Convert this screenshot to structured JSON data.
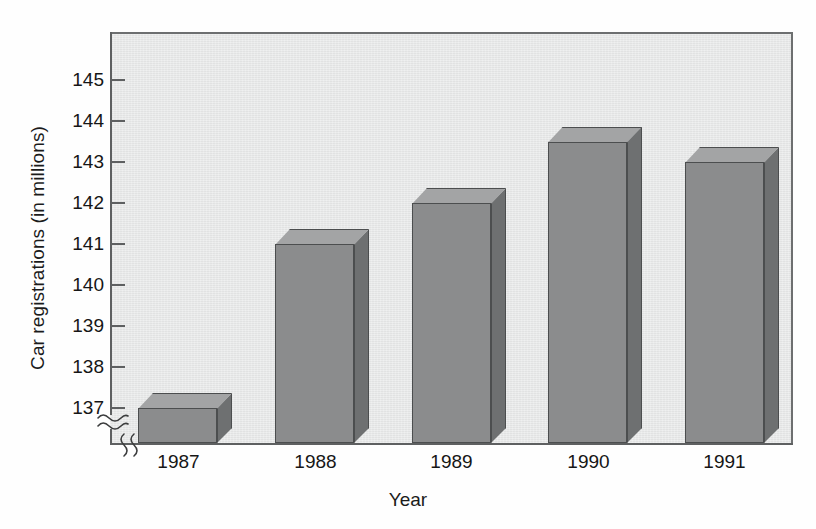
{
  "chart_data": {
    "type": "bar",
    "title": "",
    "xlabel": "Year",
    "ylabel": "Car registrations (in millions)",
    "categories": [
      "1987",
      "1988",
      "1989",
      "1990",
      "1991"
    ],
    "values": [
      137,
      141,
      142,
      143.5,
      143
    ],
    "ylim": [
      136.6,
      145.6
    ],
    "y_ticks": [
      "137",
      "138",
      "139",
      "140",
      "141",
      "142",
      "143",
      "144",
      "145"
    ],
    "y_tick_values": [
      137,
      138,
      139,
      140,
      141,
      142,
      143,
      144,
      145
    ],
    "grid": false,
    "legend": "none",
    "axis_break_y": true,
    "axis_break_x": true,
    "series": [
      {
        "name": "Car registrations",
        "values": [
          137,
          141,
          142,
          143.5,
          143
        ]
      }
    ],
    "colors": {
      "bar_front": "#8b8c8d",
      "bar_top": "#a3a4a5",
      "bar_side": "#6e7071",
      "bar_outline": "#4c4e4f",
      "plot_background": "#e8e9e9",
      "axis": "#5e6061",
      "text": "#161616",
      "page_background": "#fefefe"
    }
  },
  "axis": {
    "y_title": "Car registrations (in millions)",
    "x_title": "Year",
    "y_labels": [
      "145",
      "144",
      "143",
      "142",
      "141",
      "140",
      "139",
      "138",
      "137"
    ],
    "x_labels": [
      "1987",
      "1988",
      "1989",
      "1990",
      "1991"
    ]
  },
  "icons": {
    "y_break": "axis-break-squiggle",
    "x_break": "axis-break-squiggle"
  }
}
